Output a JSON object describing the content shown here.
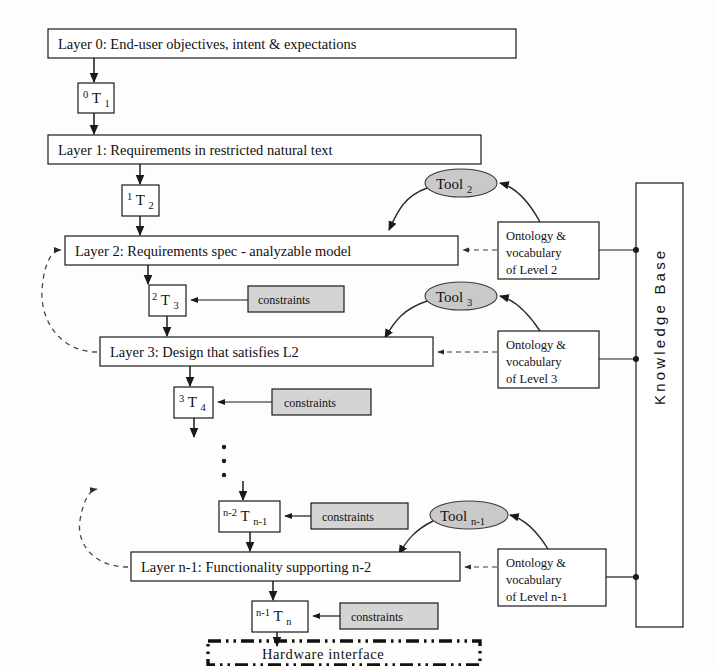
{
  "diagram": {
    "layers": [
      {
        "id": "layer0",
        "label": "Layer 0: End-user objectives, intent & expectations"
      },
      {
        "id": "layer1",
        "label": "Layer 1: Requirements in restricted natural text"
      },
      {
        "id": "layer2",
        "label": "Layer 2: Requirements spec - analyzable model"
      },
      {
        "id": "layer3",
        "label": "Layer 3: Design that satisfies L2"
      },
      {
        "id": "layern1",
        "label": "Layer n-1: Functionality supporting n-2"
      }
    ],
    "transforms": [
      {
        "id": "t1",
        "sup": "0",
        "base": "T",
        "sub": "1"
      },
      {
        "id": "t2",
        "sup": "1",
        "base": "T",
        "sub": "2"
      },
      {
        "id": "t3",
        "sup": "2",
        "base": "T",
        "sub": "3"
      },
      {
        "id": "t4",
        "sup": "3",
        "base": "T",
        "sub": "4"
      },
      {
        "id": "tn1",
        "sup": "n-2",
        "base": "T",
        "sub": "n-1"
      },
      {
        "id": "tn",
        "sup": "n-1",
        "base": "T",
        "sub": "n"
      }
    ],
    "tools": [
      {
        "id": "tool2",
        "base": "Tool",
        "sub": "2"
      },
      {
        "id": "tool3",
        "base": "Tool",
        "sub": "3"
      },
      {
        "id": "tooln1",
        "base": "Tool",
        "sub": "n-1"
      }
    ],
    "constraints": [
      {
        "id": "constraints_t3",
        "label": "constraints"
      },
      {
        "id": "constraints_t4",
        "label": "constraints"
      },
      {
        "id": "constraints_tn1",
        "label": "constraints"
      },
      {
        "id": "constraints_tn",
        "label": "constraints"
      }
    ],
    "ontologies": [
      {
        "id": "onto2",
        "line1": "Ontology &",
        "line2": "vocabulary",
        "line3": "of Level 2"
      },
      {
        "id": "onto3",
        "line1": "Ontology &",
        "line2": "vocabulary",
        "line3": "of Level 3"
      },
      {
        "id": "onton1",
        "line1": "Ontology &",
        "line2": "vocabulary",
        "line3": "of Level n-1"
      }
    ],
    "knowledge_base": {
      "id": "kb",
      "label": "Knowledge Base"
    },
    "hardware_interface": {
      "id": "hw",
      "label": "Hardware interface"
    },
    "ellipsis": {
      "id": "vertical-ellipsis",
      "dots": 3
    },
    "colors": {
      "box_fill": "#ffffff",
      "gray_fill": "#d4d4d4",
      "tool_fill": "#c9c9c9",
      "stroke": "#1a1a1a",
      "background": "#fdfdfc"
    }
  }
}
